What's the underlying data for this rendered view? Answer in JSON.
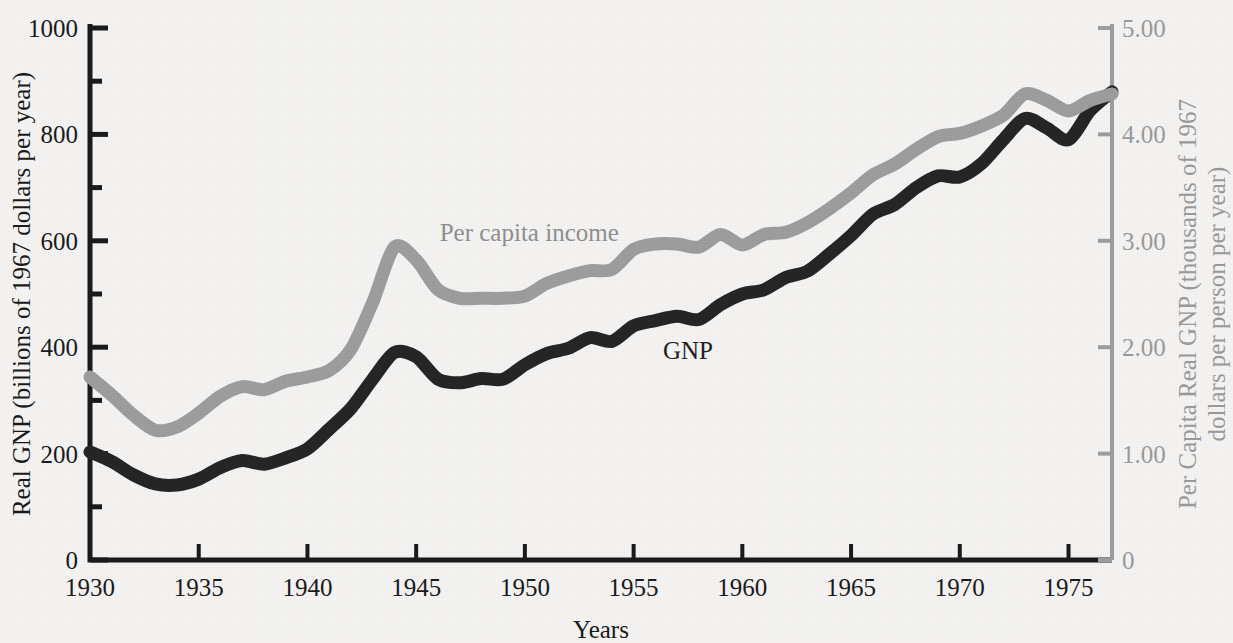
{
  "figure": {
    "background_color": "#f4f3f1",
    "width": 1233,
    "height": 643
  },
  "chart_data": {
    "type": "line",
    "title": "",
    "subtitle": "",
    "xlabel": "Years",
    "ylabel": "Real GNP (billions of 1967 dollars per year)",
    "ylabel_right": "Per Capita Real GNP (thousands of 1967 dollars per person per year)",
    "xlim": [
      1930,
      1977
    ],
    "ylim": [
      0,
      1000
    ],
    "ylim_right": [
      0,
      5.0
    ],
    "grid": false,
    "legend_position": "inline-annotation",
    "xticks": [
      1930,
      1935,
      1940,
      1945,
      1950,
      1955,
      1960,
      1965,
      1970,
      1975
    ],
    "xtick_labels": [
      "1930",
      "1935",
      "1940",
      "1945",
      "1950",
      "1955",
      "1960",
      "1965",
      "1970",
      "1975"
    ],
    "yticks_left": [
      0,
      200,
      400,
      600,
      800,
      1000
    ],
    "ytick_labels_left": [
      "0",
      "200",
      "400",
      "600",
      "800",
      "1000"
    ],
    "yminor_left": [
      100,
      300,
      500,
      700,
      900
    ],
    "yticks_right": [
      0,
      1.0,
      2.0,
      3.0,
      4.0,
      5.0
    ],
    "ytick_labels_right": [
      "0",
      "1.00",
      "2.00",
      "3.00",
      "4.00",
      "5.00"
    ],
    "colors": {
      "gnp": "#252525",
      "per_capita_income": "#9d9d9d",
      "axis_left": "#1a1a1a",
      "axis_right": "#9d9d9d"
    },
    "x": [
      1930,
      1931,
      1932,
      1933,
      1934,
      1935,
      1936,
      1937,
      1938,
      1939,
      1940,
      1941,
      1942,
      1943,
      1944,
      1945,
      1946,
      1947,
      1948,
      1949,
      1950,
      1951,
      1952,
      1953,
      1954,
      1955,
      1956,
      1957,
      1958,
      1959,
      1960,
      1961,
      1962,
      1963,
      1964,
      1965,
      1966,
      1967,
      1968,
      1969,
      1970,
      1971,
      1972,
      1973,
      1974,
      1975,
      1976,
      1977
    ],
    "series": [
      {
        "name": "GNP",
        "label": "GNP",
        "axis": "left",
        "color": "#252525",
        "units": "billions of 1967 dollars per year",
        "values": [
          203,
          185,
          160,
          143,
          141,
          152,
          174,
          187,
          180,
          192,
          209,
          246,
          285,
          340,
          390,
          382,
          340,
          333,
          341,
          340,
          367,
          388,
          398,
          418,
          411,
          440,
          450,
          458,
          452,
          480,
          500,
          508,
          531,
          543,
          575,
          610,
          650,
          668,
          700,
          722,
          720,
          745,
          790,
          830,
          812,
          790,
          845,
          880
        ]
      },
      {
        "name": "Per capita income",
        "label": "Per capita income",
        "axis": "right",
        "color": "#9d9d9d",
        "units": "thousands of 1967 dollars per person per year",
        "values": [
          1.72,
          1.55,
          1.36,
          1.22,
          1.25,
          1.38,
          1.54,
          1.63,
          1.6,
          1.68,
          1.72,
          1.78,
          1.98,
          2.42,
          2.94,
          2.82,
          2.54,
          2.46,
          2.46,
          2.46,
          2.48,
          2.6,
          2.67,
          2.72,
          2.73,
          2.92,
          2.97,
          2.97,
          2.94,
          3.06,
          2.96,
          3.06,
          3.08,
          3.17,
          3.3,
          3.45,
          3.62,
          3.72,
          3.86,
          3.98,
          4.01,
          4.08,
          4.18,
          4.38,
          4.32,
          4.22,
          4.32,
          4.38
        ]
      }
    ],
    "annotations": [
      {
        "text": "Per capita income",
        "x": 1950.2,
        "y_left": 600,
        "color": "#8f8f8f"
      },
      {
        "text": "GNP",
        "x": 1957.5,
        "y_left": 378,
        "color": "#202020"
      }
    ]
  }
}
